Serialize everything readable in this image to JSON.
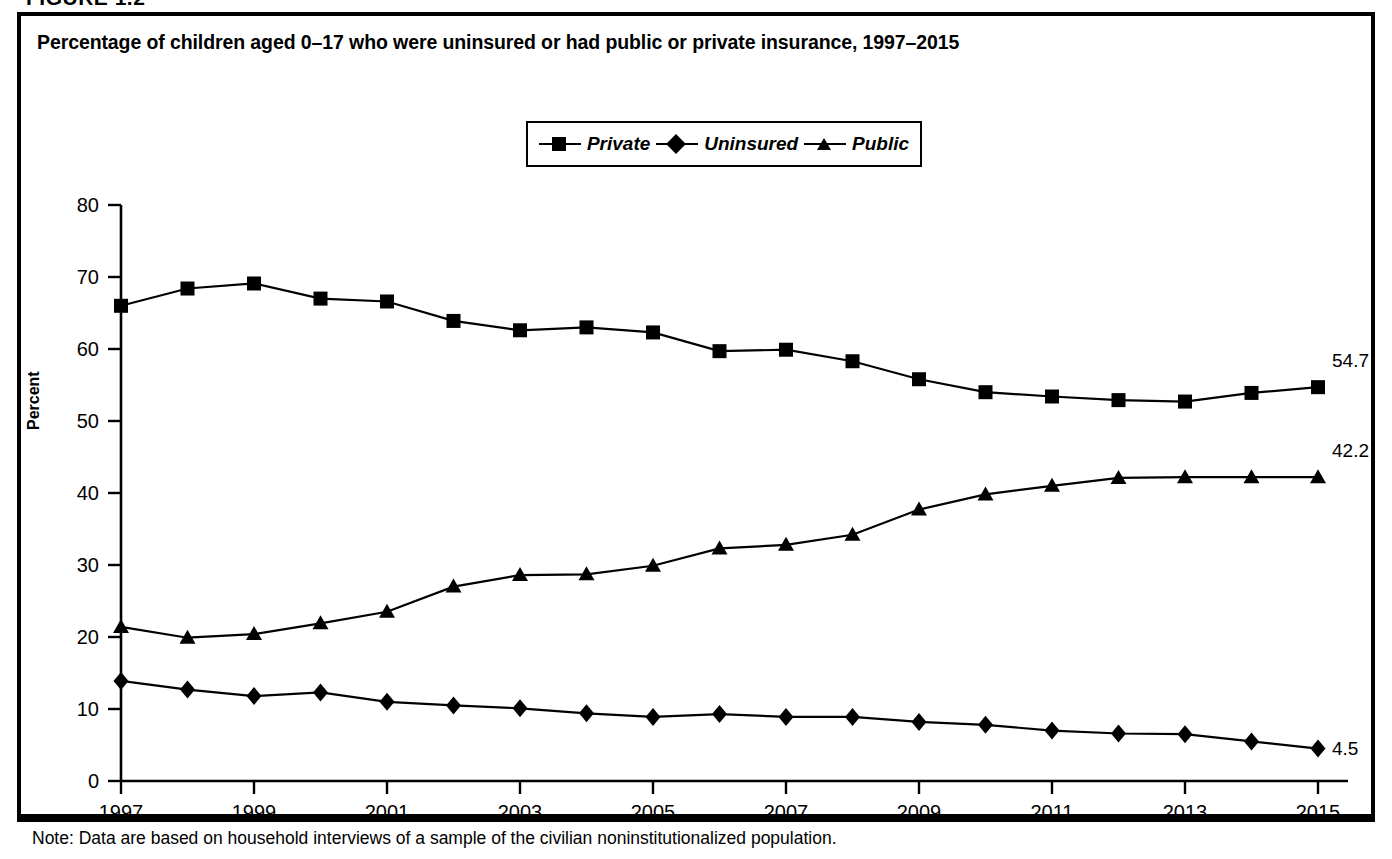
{
  "figure": {
    "number_label": "FIGURE 1.2",
    "title": "Percentage of children aged 0–17 who were uninsured or had public or private insurance, 1997–2015",
    "note": "Note: Data are based on household interviews of a sample of the civilian noninstitutionalized population."
  },
  "legend": {
    "items": [
      {
        "label": "Private",
        "marker": "square"
      },
      {
        "label": "Uninsured",
        "marker": "diamond"
      },
      {
        "label": "Public",
        "marker": "triangle"
      }
    ]
  },
  "axes": {
    "y_label": "Percent",
    "y_ticks": [
      "0",
      "10",
      "20",
      "30",
      "40",
      "50",
      "60",
      "70",
      "80"
    ],
    "x_ticks": [
      "1997",
      "1999",
      "2001",
      "2003",
      "2005",
      "2007",
      "2009",
      "2011",
      "2013",
      "2015"
    ]
  },
  "end_labels": {
    "private": "54.7",
    "public": "42.2",
    "uninsured": "4.5"
  },
  "colors": {
    "ink": "#000000",
    "background": "#ffffff"
  },
  "chart_data": {
    "type": "line",
    "title": "Percentage of children aged 0–17 who were uninsured or had public or private insurance, 1997–2015",
    "xlabel": "",
    "ylabel": "Percent",
    "ylim": [
      0,
      80
    ],
    "xlim": [
      1997,
      2015
    ],
    "ytick_step": 10,
    "xtick_step": 2,
    "grid": false,
    "legend_position": "top-center",
    "x": [
      1997,
      1998,
      1999,
      2000,
      2001,
      2002,
      2003,
      2004,
      2005,
      2006,
      2007,
      2008,
      2009,
      2010,
      2011,
      2012,
      2013,
      2014,
      2015
    ],
    "series": [
      {
        "name": "Private",
        "marker": "square",
        "end_label": "54.7",
        "values": [
          66.0,
          68.4,
          69.1,
          67.0,
          66.6,
          63.9,
          62.6,
          63.0,
          62.3,
          59.7,
          59.9,
          58.3,
          55.8,
          54.0,
          53.4,
          52.9,
          52.7,
          53.9,
          54.7
        ]
      },
      {
        "name": "Uninsured",
        "marker": "diamond",
        "end_label": "4.5",
        "values": [
          13.9,
          12.7,
          11.8,
          12.3,
          11.0,
          10.5,
          10.1,
          9.4,
          8.9,
          9.3,
          8.9,
          8.9,
          8.2,
          7.8,
          7.0,
          6.6,
          6.5,
          5.5,
          4.5
        ]
      },
      {
        "name": "Public",
        "marker": "triangle",
        "end_label": "42.2",
        "values": [
          21.4,
          19.9,
          20.4,
          21.9,
          23.5,
          27.0,
          28.6,
          28.7,
          29.9,
          32.3,
          32.8,
          34.2,
          37.7,
          39.8,
          41.0,
          42.1,
          42.2,
          42.2,
          42.2
        ]
      }
    ]
  }
}
